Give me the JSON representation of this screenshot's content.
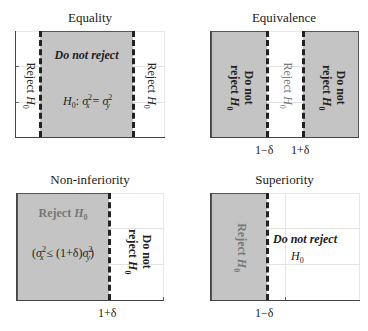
{
  "panels": [
    {
      "title": "Equality",
      "regions": {
        "left": "Reject H0",
        "center": "Do not reject",
        "center_hypothesis": "H0: σx² = σy²",
        "right": "Reject H0"
      },
      "ticks": []
    },
    {
      "title": "Equivalence",
      "regions": {
        "left": "Do not reject H0",
        "center": "Reject H0",
        "right": "Do not reject H0"
      },
      "ticks": [
        "1−δ",
        "1+δ"
      ]
    },
    {
      "title": "Non-inferiority",
      "regions": {
        "left": "Reject H0",
        "left_condition": "(σx² ≤ (1+δ)σy²)",
        "right": "Do not reject H0"
      },
      "ticks": [
        "1+δ"
      ]
    },
    {
      "title": "Superiority",
      "regions": {
        "left": "Reject H0",
        "right": "Do not reject H0"
      },
      "ticks": [
        "1−δ"
      ]
    }
  ],
  "text": {
    "reject": "Reject ",
    "h": "H",
    "sub0": "0",
    "do_not_reject": "Do not reject",
    "do_not": "Do not",
    "reject_lc": "reject ",
    "sigma": "σ",
    "x": "x",
    "y": "y",
    "two": "2",
    "colon_part": ": ",
    "eq": " = ",
    "leq_part": " ≤ (1+δ)",
    "open_paren": "(",
    "close_paren": ")",
    "tick_minus": "1−δ",
    "tick_plus": "1+δ"
  },
  "colors": {
    "shade": "#c4c4c4",
    "boundary": "#222222",
    "grid": "#e4e4e4"
  }
}
